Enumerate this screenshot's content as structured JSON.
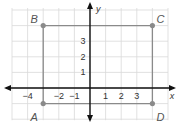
{
  "diagram": {
    "type": "coordinate-grid-rectangle",
    "grid": {
      "x_min": -5,
      "x_max": 5,
      "y_min": -2,
      "y_max": 5,
      "color": "#d9d9d9"
    },
    "axes": {
      "x_label": "x",
      "y_label": "y",
      "x_ticks": [
        {
          "value": -4,
          "label": "−4"
        },
        {
          "value": -2,
          "label": "−2"
        },
        {
          "value": -1,
          "label": "−1"
        },
        {
          "value": 1,
          "label": "1"
        },
        {
          "value": 2,
          "label": "2"
        },
        {
          "value": 3,
          "label": "3"
        }
      ],
      "y_ticks": [
        {
          "value": 1,
          "label": "1"
        },
        {
          "value": 2,
          "label": "2"
        },
        {
          "value": 3,
          "label": "3"
        }
      ],
      "color": "#111111"
    },
    "rectangle": {
      "color": "#8a8a8a",
      "vertices": [
        {
          "name": "B",
          "x": -3,
          "y": 4
        },
        {
          "name": "C",
          "x": 4,
          "y": 4
        },
        {
          "name": "D",
          "x": 4,
          "y": -1
        },
        {
          "name": "A",
          "x": -3,
          "y": -1
        }
      ]
    }
  }
}
